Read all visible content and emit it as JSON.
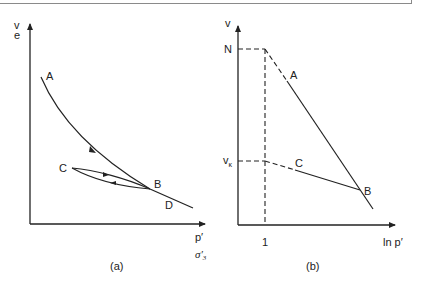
{
  "figure": {
    "panel_a": {
      "caption": "(a)",
      "y_axis_labels": [
        "v",
        "e"
      ],
      "x_axis_labels": [
        "p′",
        "σ′",
        "3"
      ],
      "points": {
        "A": "A",
        "B": "B",
        "C": "C",
        "D": "D"
      },
      "description": "Normal compression curve A→B→D with unload-reload loop B–C"
    },
    "panel_b": {
      "caption": "(b)",
      "y_axis_label": "v",
      "x_axis_label": "ln p′",
      "x_tick": "1",
      "y_ticks": {
        "N": "N",
        "v_kappa": "v",
        "kappa": "κ"
      },
      "points": {
        "A": "A",
        "B": "B",
        "C": "C"
      },
      "description": "Linear NCL A–B extrapolated to N at ln p′=1; swelling line C–B extrapolated to vκ"
    }
  }
}
